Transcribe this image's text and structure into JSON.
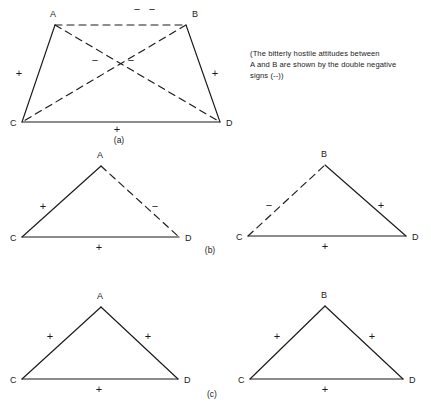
{
  "figure": {
    "stroke_color": "#1a1a1a",
    "background_color": "#ffffff",
    "panels": [
      {
        "id": "a",
        "label": "(a)",
        "label_x": 119,
        "label_y": 143,
        "shape": "quadrilateral",
        "vertices": [
          {
            "name": "A",
            "x": 55,
            "y": 25,
            "label_x": 50,
            "label_y": 17
          },
          {
            "name": "B",
            "x": 186,
            "y": 25,
            "label_x": 192,
            "label_y": 17
          },
          {
            "name": "C",
            "x": 22,
            "y": 122,
            "label_x": 10,
            "label_y": 126
          },
          {
            "name": "D",
            "x": 220,
            "y": 122,
            "label_x": 226,
            "label_y": 126
          }
        ],
        "edges": [
          {
            "from": "A",
            "to": "B",
            "style": "dashed",
            "sign": "--",
            "sign_x": 137,
            "sign_y": 13
          },
          {
            "from": "A",
            "to": "C",
            "style": "solid",
            "sign": "+",
            "sign_x": 19,
            "sign_y": 77
          },
          {
            "from": "B",
            "to": "D",
            "style": "solid",
            "sign": "+",
            "sign_x": 215,
            "sign_y": 77
          },
          {
            "from": "C",
            "to": "D",
            "style": "solid",
            "sign": "+",
            "sign_x": 117,
            "sign_y": 133
          },
          {
            "from": "A",
            "to": "D",
            "style": "dashed",
            "sign": "-",
            "sign_x": 131,
            "sign_y": 64
          },
          {
            "from": "B",
            "to": "C",
            "style": "dashed",
            "sign": "-",
            "sign_x": 95,
            "sign_y": 64
          }
        ]
      },
      {
        "id": "b-left",
        "label": "",
        "shape": "triangle",
        "vertices": [
          {
            "name": "A",
            "x": 101,
            "y": 166,
            "label_x": 97,
            "label_y": 158
          },
          {
            "name": "C",
            "x": 22,
            "y": 237,
            "label_x": 10,
            "label_y": 241
          },
          {
            "name": "D",
            "x": 179,
            "y": 237,
            "label_x": 185,
            "label_y": 241
          }
        ],
        "edges": [
          {
            "from": "C",
            "to": "A",
            "style": "solid",
            "sign": "+",
            "sign_x": 43,
            "sign_y": 210
          },
          {
            "from": "A",
            "to": "D",
            "style": "dashed",
            "sign": "-",
            "sign_x": 155,
            "sign_y": 210
          },
          {
            "from": "C",
            "to": "D",
            "style": "solid",
            "sign": "+",
            "sign_x": 99,
            "sign_y": 251
          }
        ]
      },
      {
        "id": "b-right",
        "label": "",
        "shape": "triangle",
        "vertices": [
          {
            "name": "B",
            "x": 325,
            "y": 165,
            "label_x": 321,
            "label_y": 157
          },
          {
            "name": "C",
            "x": 248,
            "y": 236,
            "label_x": 236,
            "label_y": 240
          },
          {
            "name": "D",
            "x": 406,
            "y": 236,
            "label_x": 412,
            "label_y": 240
          }
        ],
        "edges": [
          {
            "from": "C",
            "to": "B",
            "style": "dashed",
            "sign": "-",
            "sign_x": 269,
            "sign_y": 209
          },
          {
            "from": "B",
            "to": "D",
            "style": "solid",
            "sign": "+",
            "sign_x": 381,
            "sign_y": 209
          },
          {
            "from": "C",
            "to": "D",
            "style": "solid",
            "sign": "+",
            "sign_x": 325,
            "sign_y": 250
          }
        ]
      },
      {
        "id": "b",
        "label": "(b)",
        "label_x": 210,
        "label_y": 253,
        "shape": "label-only",
        "vertices": [],
        "edges": []
      },
      {
        "id": "c-left",
        "label": "",
        "shape": "triangle",
        "vertices": [
          {
            "name": "A",
            "x": 101,
            "y": 307,
            "label_x": 97,
            "label_y": 299
          },
          {
            "name": "C",
            "x": 22,
            "y": 379,
            "label_x": 10,
            "label_y": 383
          },
          {
            "name": "D",
            "x": 178,
            "y": 379,
            "label_x": 184,
            "label_y": 383
          }
        ],
        "edges": [
          {
            "from": "C",
            "to": "A",
            "style": "solid",
            "sign": "+",
            "sign_x": 50,
            "sign_y": 340
          },
          {
            "from": "A",
            "to": "D",
            "style": "solid",
            "sign": "+",
            "sign_x": 148,
            "sign_y": 340
          },
          {
            "from": "C",
            "to": "D",
            "style": "solid",
            "sign": "+",
            "sign_x": 99,
            "sign_y": 393
          }
        ]
      },
      {
        "id": "c-right",
        "label": "",
        "shape": "triangle",
        "vertices": [
          {
            "name": "B",
            "x": 325,
            "y": 306,
            "label_x": 321,
            "label_y": 298
          },
          {
            "name": "C",
            "x": 250,
            "y": 379,
            "label_x": 238,
            "label_y": 383
          },
          {
            "name": "D",
            "x": 403,
            "y": 379,
            "label_x": 409,
            "label_y": 383
          }
        ],
        "edges": [
          {
            "from": "C",
            "to": "B",
            "style": "solid",
            "sign": "+",
            "sign_x": 277,
            "sign_y": 340
          },
          {
            "from": "B",
            "to": "D",
            "style": "solid",
            "sign": "+",
            "sign_x": 372,
            "sign_y": 340
          },
          {
            "from": "C",
            "to": "D",
            "style": "solid",
            "sign": "+",
            "sign_x": 325,
            "sign_y": 393
          }
        ]
      },
      {
        "id": "c",
        "label": "(c)",
        "label_x": 212,
        "label_y": 397,
        "shape": "label-only",
        "vertices": [],
        "edges": []
      }
    ],
    "caption": {
      "lines": [
        "(The bitterly hostile attitudes between",
        "A and B are shown by the double negative",
        "signs (--))"
      ]
    }
  }
}
